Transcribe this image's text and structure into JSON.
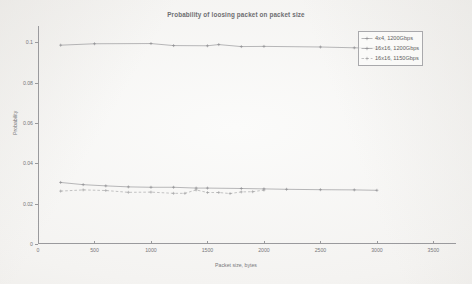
{
  "chart_data": {
    "type": "line",
    "title": "Probability of loosing packet on packet size",
    "xlabel": "Packet size, bytes",
    "ylabel": "Probability",
    "xlim": [
      0,
      3700
    ],
    "ylim": [
      0,
      0.108
    ],
    "xticks": [
      0,
      500,
      1000,
      1500,
      2000,
      2500,
      3000,
      3500
    ],
    "xticklabels": [
      "0",
      "500",
      "1000",
      "1500",
      "2000",
      "2500",
      "3000",
      "3500"
    ],
    "yticks": [
      0,
      0.02,
      0.04,
      0.06,
      0.08,
      0.1
    ],
    "yticklabels": [
      "0",
      "0.02",
      "0.04",
      "0.06",
      "0.08",
      "0.1"
    ],
    "grid": false,
    "legend_position": "top-right",
    "marker": "plus",
    "series": [
      {
        "name": "4x4, 1200Gbps",
        "color": "#8a8a8d",
        "linestyle": "solid",
        "x": [
          200,
          500,
          1000,
          1200,
          1500,
          1600,
          1800,
          2000,
          2500,
          2800,
          3000
        ],
        "y": [
          0.0985,
          0.0992,
          0.0993,
          0.0983,
          0.0982,
          0.0988,
          0.0978,
          0.0979,
          0.0976,
          0.0972,
          0.097
        ]
      },
      {
        "name": "16x16, 1200Gbps",
        "color": "#8a8a8d",
        "linestyle": "solid",
        "x": [
          200,
          400,
          600,
          800,
          1000,
          1200,
          1400,
          1500,
          1800,
          2000,
          2200,
          2500,
          2800,
          3000
        ],
        "y": [
          0.0305,
          0.0294,
          0.0288,
          0.0283,
          0.0281,
          0.0281,
          0.0277,
          0.0277,
          0.0275,
          0.0273,
          0.0271,
          0.0269,
          0.0268,
          0.0266
        ]
      },
      {
        "name": "16x16, 1150Gbps",
        "color": "#9d9da0",
        "linestyle": "dashed",
        "x": [
          200,
          400,
          600,
          800,
          1000,
          1200,
          1300,
          1400,
          1500,
          1600,
          1700,
          1800,
          1900,
          2000
        ],
        "y": [
          0.0262,
          0.0268,
          0.0265,
          0.0256,
          0.0257,
          0.0251,
          0.0251,
          0.0268,
          0.0255,
          0.0255,
          0.025,
          0.0258,
          0.0259,
          0.0267
        ]
      }
    ]
  },
  "legend": {
    "entries": [
      {
        "label": "4x4, 1200Gbps"
      },
      {
        "label": "16x16, 1200Gbps"
      },
      {
        "label": "16x16, 1150Gbps"
      }
    ]
  }
}
